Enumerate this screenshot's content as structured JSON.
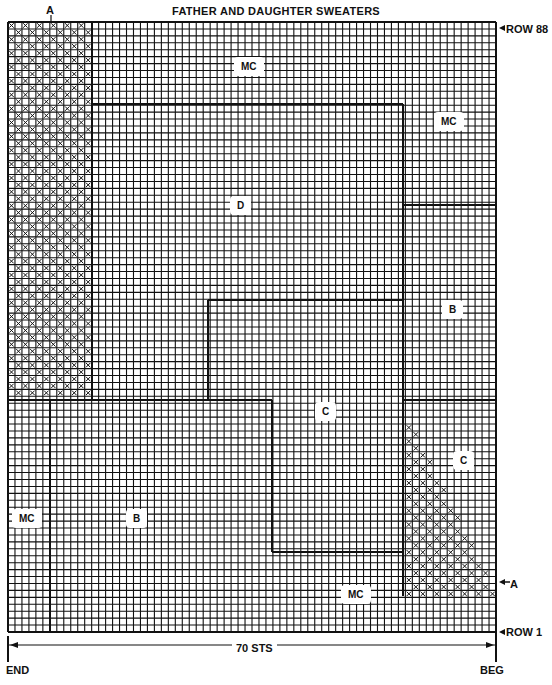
{
  "title": "FATHER AND DAUGHTER SWEATERS",
  "labels": {
    "top_marker": "A",
    "row_top": "ROW 88",
    "row_bottom": "ROW 1",
    "right_marker": "A",
    "stitch_count": "70 STS",
    "end": "END",
    "beg": "BEG"
  },
  "chart": {
    "stitches": 70,
    "rows": 88,
    "grid_color": "#111111",
    "background": "#ffffff"
  },
  "regions": [
    {
      "name": "MC",
      "label": "MC"
    },
    {
      "name": "MC-right",
      "label": "MC"
    },
    {
      "name": "D",
      "label": "D"
    },
    {
      "name": "B-right",
      "label": "B"
    },
    {
      "name": "C-center",
      "label": "C"
    },
    {
      "name": "C-right",
      "label": "C"
    },
    {
      "name": "MC-left",
      "label": "MC"
    },
    {
      "name": "B-left",
      "label": "B"
    },
    {
      "name": "MC-bottom",
      "label": "MC"
    }
  ]
}
